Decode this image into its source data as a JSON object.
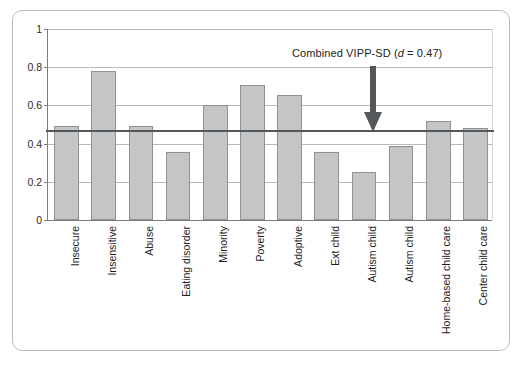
{
  "figure": {
    "frame_border_color": "#b9bcbe",
    "background": "#ffffff"
  },
  "chart_data": {
    "type": "bar",
    "title": "",
    "xlabel": "",
    "ylabel": "",
    "ylim": [
      0,
      1
    ],
    "grid": true,
    "legend_position": "none",
    "categories": [
      "Insecure",
      "Insensitive",
      "Abuse",
      "Eating disorder",
      "Minority",
      "Poverty",
      "Adoptive",
      "Ext child",
      "Autism child",
      "Autism child",
      "Home-based child care",
      "Center child care"
    ],
    "values": [
      0.49,
      0.78,
      0.49,
      0.355,
      0.6,
      0.705,
      0.655,
      0.355,
      0.25,
      0.385,
      0.52,
      0.48
    ],
    "ytick_labels": [
      "0",
      "0.2",
      "0.4",
      "0.6",
      "0.8",
      "1"
    ],
    "ytick_values": [
      0,
      0.2,
      0.4,
      0.6,
      0.8,
      1
    ],
    "bar_fill_color": "#c4c5c6",
    "bar_edge_color": "#8f9193",
    "gridline_color": "#b7babc",
    "axis_color": "#7b7e80",
    "annotations": [
      {
        "name": "combined-effect-reference",
        "text_prefix": "Combined VIPP-SD (",
        "text_italic": "d",
        "text_suffix": " = 0.47)",
        "full_text": "Combined VIPP-SD (d = 0.47)",
        "value": 0.47,
        "line_color": "#55585a",
        "arrow_color": "#55585a",
        "arrow_points_to": 0.47
      }
    ]
  }
}
